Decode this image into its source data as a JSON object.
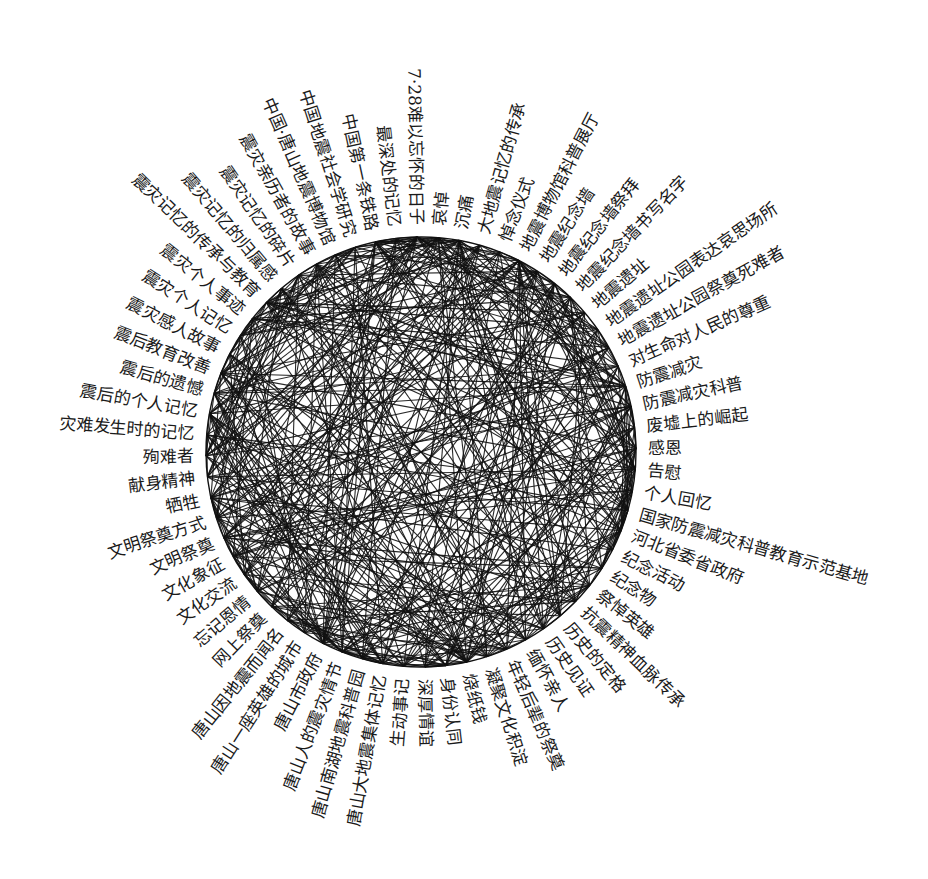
{
  "diagram": {
    "type": "circular-network",
    "center": [
      421,
      452
    ],
    "radius": 215,
    "label_offset": 12,
    "start_angle_deg": -91,
    "direction": "clockwise",
    "colors": {
      "edge": "#111111",
      "text": "#1a1a1a",
      "background": "#ffffff"
    },
    "nodes": [
      "7·28难以忘怀的日子",
      "哀悼",
      "沉痛",
      "大地震记忆的传承",
      "悼念仪式",
      "地震博物馆科普展厅",
      "地震纪念墙",
      "地震纪念墙祭拜",
      "地震纪念墙书写名字",
      "地震遗址",
      "地震遗址公园表达哀思场所",
      "地震遗址公园祭奠死难者",
      "对生命对人民的尊重",
      "防震减灾",
      "防震减灾科普",
      "废墟上的崛起",
      "感恩",
      "告慰",
      "个人回忆",
      "国家防震减灾科普教育示范基地",
      "河北省委省政府",
      "纪念活动",
      "纪念物",
      "祭悼英雄",
      "抗震精神血脉传承",
      "历史的定格",
      "历史见证",
      "缅怀亲人",
      "年轻后辈的祭奠",
      "凝聚文化积淀",
      "烧纸钱",
      "身份认同",
      "深厚情谊",
      "生动事记",
      "唐山大地震集体记忆",
      "唐山南湖地震科普园",
      "唐山人的震灾情节",
      "唐山市政府",
      "唐山一座英雄的城市",
      "唐山因地震而闻名",
      "网上祭奠",
      "忘记恩情",
      "文化交流",
      "文化象征",
      "文明祭奠",
      "文明祭奠方式",
      "牺牲",
      "献身精神",
      "殉难者",
      "灾难发生时的记忆",
      "震后的个人记忆",
      "震后的遗憾",
      "震后教育改善",
      "震灾感人故事",
      "震灾个人记忆",
      "震灾个人事迹",
      "震灾记忆的传承与教育",
      "震灾记忆的归属感",
      "震灾记忆的碎片",
      "震灾亲历者的故事",
      "中国·唐山地震博物馆",
      "中国地震社会学研究",
      "中国第一条铁路",
      "最深处的记忆"
    ],
    "hub_nodes": [
      0,
      1,
      2,
      5,
      13,
      16,
      17,
      23,
      30,
      34,
      36,
      37,
      46,
      48,
      56,
      60
    ],
    "edge_density_note": "dense, unlabeled, unweighted co-occurrence links"
  }
}
